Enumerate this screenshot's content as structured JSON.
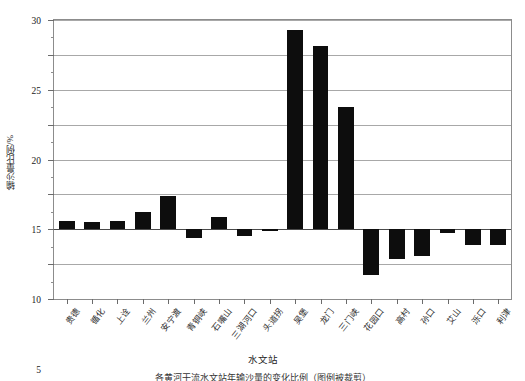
{
  "chart_data": {
    "type": "bar",
    "title": "",
    "xlabel": "水文站",
    "ylabel": "输沙量比例/%",
    "ylim": [
      -10,
      30
    ],
    "yticks": [
      -10,
      -5,
      0,
      5,
      10,
      15,
      20,
      25,
      30
    ],
    "ytick_labels": [
      "-10",
      "-5",
      "0",
      "5",
      "10",
      "15",
      "20",
      "25",
      "30"
    ],
    "yminor_step": 2.5,
    "grid": true,
    "legend": "none",
    "bar_color": "#0d0d0d",
    "categories": [
      "贵德",
      "循化",
      "上诠",
      "兰州",
      "安宁渡",
      "青铜峡",
      "石嘴山",
      "三湖河口",
      "头道拐",
      "吴堡",
      "龙门",
      "三门峡",
      "花园口",
      "高村",
      "孙口",
      "艾山",
      "泺口",
      "利津"
    ],
    "values": [
      1.2,
      1.0,
      1.2,
      2.5,
      4.7,
      -1.2,
      1.7,
      -1.0,
      -0.2,
      28.5,
      26.3,
      17.5,
      -6.5,
      -4.2,
      -3.8,
      -0.6,
      -2.2,
      -2.2
    ]
  },
  "axis": {
    "y_title": "输沙量比例/%",
    "x_title": "水文站"
  },
  "caption": {
    "text": "各黄河干流水文站年输沙量的变化比例（图例被裁剪）"
  }
}
